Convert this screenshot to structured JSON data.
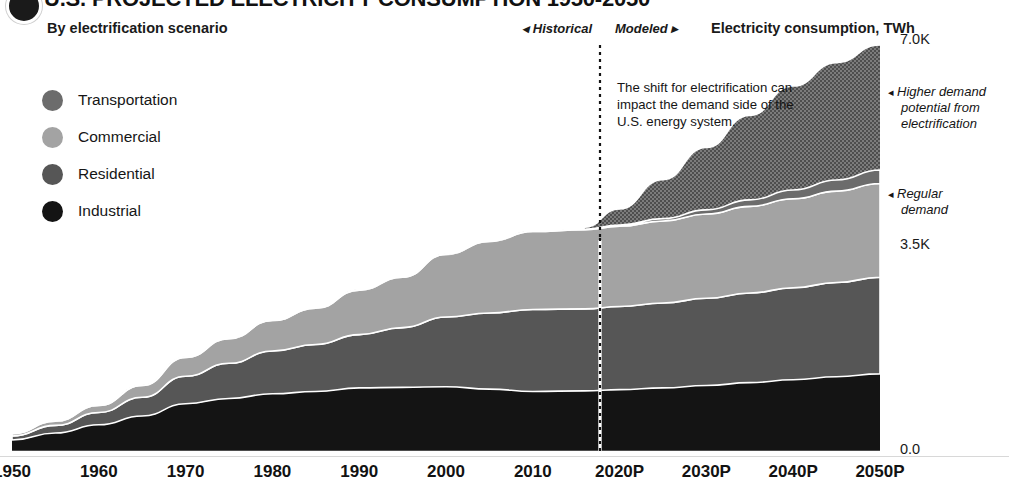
{
  "header": {
    "title": "U.S. PROJECTED ELECTRICITY CONSUMPTION 1950-2050",
    "subtitle": "By electrification scenario",
    "era_historical": "◂ Historical",
    "era_modeled": "Modeled ▸",
    "axis_title": "Electricity consumption, TWh",
    "badge_icon": "dot-badge-icon"
  },
  "legend": {
    "items": [
      {
        "label": "Transportation",
        "color": "#6c6c6c"
      },
      {
        "label": "Commercial",
        "color": "#a3a3a3"
      },
      {
        "label": "Residential",
        "color": "#565656"
      },
      {
        "label": "Industrial",
        "color": "#141414"
      }
    ]
  },
  "annotations": {
    "inline": "The shift for electrification can impact the demand side of the U.S. energy system.",
    "higher_demand_arrow": "◂",
    "higher_demand_line1": "Higher demand",
    "higher_demand_line2": "potential from",
    "higher_demand_line3": "electrification",
    "regular_demand_arrow": "◂",
    "regular_demand_line1": "Regular",
    "regular_demand_line2": "demand"
  },
  "chart_data": {
    "type": "area",
    "title": "U.S. PROJECTED ELECTRICITY CONSUMPTION 1950-2050",
    "subtitle": "By electrification scenario",
    "xlabel": "",
    "ylabel": "Electricity consumption, TWh",
    "ylim": [
      0,
      7000
    ],
    "yticks": [
      "0.0",
      "3.5K",
      "7.0K"
    ],
    "ytick_values": [
      0,
      3500,
      7000
    ],
    "xticks": [
      "1950",
      "1960",
      "1970",
      "1980",
      "1990",
      "2000",
      "2010",
      "2020P",
      "2030P",
      "2040P",
      "2050P"
    ],
    "xtick_values": [
      1950,
      1960,
      1970,
      1980,
      1990,
      2000,
      2010,
      2020,
      2030,
      2040,
      2050
    ],
    "xlim": [
      1950,
      2050
    ],
    "grid": false,
    "legend_position": "upper-left",
    "stacked": true,
    "stack_order_bottom_to_top": [
      "Industrial",
      "Residential",
      "Commercial",
      "Transportation"
    ],
    "divider": {
      "year": 2016,
      "style": "dotted",
      "label_left": "Historical",
      "label_right": "Modeled"
    },
    "x": [
      1950,
      1955,
      1960,
      1965,
      1970,
      1975,
      1980,
      1985,
      1990,
      1995,
      2000,
      2005,
      2010,
      2016,
      2020,
      2025,
      2030,
      2035,
      2040,
      2045,
      2050
    ],
    "series": [
      {
        "name": "Industrial",
        "color": "#141414",
        "values": [
          170,
          290,
          430,
          580,
          790,
          880,
          960,
          1000,
          1060,
          1070,
          1080,
          1040,
          1000,
          1010,
          1030,
          1060,
          1100,
          1150,
          1200,
          1250,
          1300
        ]
      },
      {
        "name": "Residential",
        "color": "#565656",
        "values": [
          70,
          130,
          210,
          320,
          470,
          600,
          730,
          800,
          910,
          1020,
          1190,
          1300,
          1400,
          1400,
          1420,
          1450,
          1490,
          1530,
          1570,
          1610,
          1650
        ]
      },
      {
        "name": "Commercial",
        "color": "#a3a3a3",
        "values": [
          40,
          70,
          120,
          200,
          320,
          420,
          520,
          620,
          760,
          860,
          1070,
          1220,
          1330,
          1350,
          1370,
          1400,
          1440,
          1480,
          1520,
          1560,
          1600
        ]
      },
      {
        "name": "Transportation",
        "color": "#6c6c6c",
        "values": [
          10,
          10,
          10,
          10,
          10,
          10,
          10,
          10,
          10,
          10,
          10,
          10,
          10,
          10,
          20,
          40,
          70,
          110,
          150,
          190,
          230
        ]
      }
    ],
    "regular_demand_total": [
      290,
      500,
      770,
      1110,
      1590,
      1910,
      2220,
      2430,
      2740,
      2960,
      3350,
      3570,
      3740,
      3770,
      3840,
      3950,
      4100,
      4270,
      4440,
      4610,
      4780
    ],
    "higher_demand_total": [
      290,
      500,
      770,
      1110,
      1590,
      1910,
      2220,
      2430,
      2740,
      2960,
      3350,
      3570,
      3740,
      3790,
      4100,
      4600,
      5150,
      5700,
      6200,
      6600,
      6900
    ],
    "higher_demand_band": {
      "name": "Higher demand potential from electrification",
      "texture": "hatched",
      "start_year": 2016
    }
  }
}
